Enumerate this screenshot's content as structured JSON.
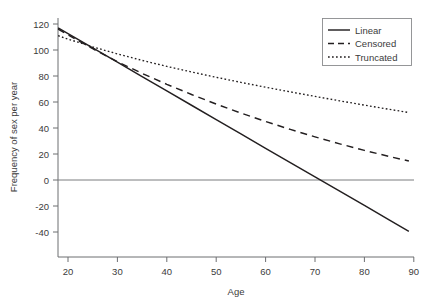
{
  "chart_data": {
    "type": "line",
    "title": "",
    "xlabel": "Age",
    "ylabel": "Frequency of sex per year",
    "xlim": [
      18,
      90
    ],
    "ylim": [
      -48,
      124
    ],
    "xticks": [
      20,
      30,
      40,
      50,
      60,
      70,
      80,
      90
    ],
    "yticks": [
      120,
      100,
      80,
      60,
      40,
      20,
      0,
      -20,
      -40
    ],
    "grid": false,
    "legend_position": "top-right",
    "reference_lines": [
      {
        "name": "zero-line",
        "orientation": "horizontal",
        "value": 0
      }
    ],
    "x": [
      18,
      20,
      25,
      30,
      35,
      40,
      45,
      50,
      55,
      60,
      65,
      70,
      75,
      80,
      85,
      89
    ],
    "series": [
      {
        "name": "Linear",
        "style": "solid",
        "color": "#231f20",
        "values": [
          117,
          112.6,
          101.6,
          90.6,
          79.6,
          68.5,
          57.5,
          46.5,
          35.5,
          24.4,
          13.4,
          2.4,
          -8.6,
          -19.6,
          -30.7,
          -39.5
        ]
      },
      {
        "name": "Censored",
        "style": "dashed",
        "color": "#231f20",
        "values": [
          116,
          111.6,
          101.0,
          91.0,
          82.0,
          73.6,
          65.8,
          58.4,
          51.5,
          45.0,
          38.9,
          33.2,
          27.8,
          22.8,
          18.1,
          14.6
        ]
      },
      {
        "name": "Truncated",
        "style": "dotted",
        "color": "#231f20",
        "values": [
          111,
          108.4,
          102.4,
          97.0,
          92.0,
          87.4,
          83.1,
          79.0,
          75.1,
          71.4,
          67.8,
          64.3,
          60.9,
          57.6,
          54.4,
          51.9
        ]
      }
    ],
    "legend": [
      {
        "label": "Linear",
        "style": "solid"
      },
      {
        "label": "Censored",
        "style": "dashed"
      },
      {
        "label": "Truncated",
        "style": "dotted"
      }
    ]
  }
}
